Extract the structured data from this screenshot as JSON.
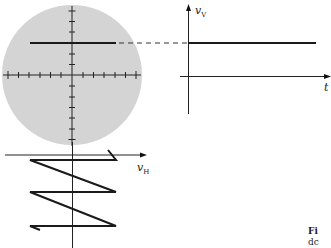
{
  "diagram": {
    "screen": {
      "shape": "circle",
      "fill_color": "#d4d4d4",
      "graticule": "crosshair with tick marks",
      "trace": "horizontal line"
    },
    "vertical_plot": {
      "y_label": "v",
      "y_label_sub": "V",
      "x_label": "t",
      "signal": "constant (DC) level"
    },
    "horizontal_plot": {
      "x_label": "v",
      "x_label_sub": "H",
      "signal": "sawtooth (time runs downward)"
    },
    "caption": {
      "line1": "Fi",
      "line2": "dc"
    },
    "colors": {
      "ink": "#1a1a1a",
      "screen": "#d4d4d4",
      "background": "#ffffff"
    }
  }
}
